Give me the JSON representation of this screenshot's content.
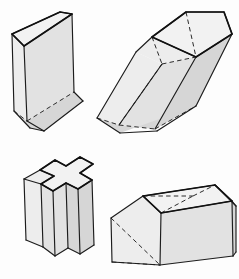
{
  "sheet": {
    "title": "Four three-dimensional solids line drawing",
    "background_color": "#fdfdfd",
    "width": 239,
    "height": 279,
    "visible_text": []
  },
  "style": {
    "visible_edge_color": "#1c1c1c",
    "hidden_edge_color": "#2b2b2b",
    "hidden_edge_style": "dashed",
    "face_fill_light": "#ededed",
    "face_fill_mid": "#e2e2e2",
    "face_fill_dark": "#d6d6d6",
    "face_fill_top": "#f2f2f2"
  },
  "figures": [
    {
      "id": "triangular-prism",
      "name": "Upright triangular prism",
      "position": "top-left",
      "solid_type": "prism",
      "cross_section": "triangle",
      "orientation": "vertical",
      "top_face": {
        "shape": "triangle",
        "points": "12,34 60,12 72,14 24,46"
      },
      "faces": [
        {
          "name": "top-triangle",
          "shade": "face-top",
          "points": "12,34 60,12 72,14 24,46"
        },
        {
          "name": "front-left-rectangle",
          "shade": "face-light",
          "points": "12,34 24,46 27,121 14,111"
        },
        {
          "name": "front-right-rectangle",
          "shade": "face-mid",
          "points": "24,46 72,14 74,92 27,121"
        },
        {
          "name": "bottom-wedge-left",
          "shade": "face-dark",
          "points": "14,111 27,121 44,131 30,128"
        },
        {
          "name": "bottom-wedge-right",
          "shade": "face-dark",
          "points": "27,121 74,92 83,101 44,131"
        }
      ],
      "visible_edges": [
        "12,34 60,12",
        "60,12 72,14",
        "72,14 24,46",
        "24,46 12,34",
        "12,34 14,111",
        "24,46 27,121",
        "72,14 74,92",
        "14,111 30,128",
        "30,128 44,131",
        "44,131 83,101",
        "83,101 74,92",
        "27,121 44,131"
      ],
      "hidden_edges": [
        "14,111 27,121",
        "27,121 74,92"
      ]
    },
    {
      "id": "oblique-pentagonal-prism",
      "name": "Oblique pentagonal prism leaning to the right",
      "position": "top-right",
      "solid_type": "prism",
      "cross_section": "pentagon",
      "orientation": "oblique",
      "top_face": {
        "shape": "pentagon",
        "points": "152,37 186,12 224,12 232,34 196,57"
      },
      "faces": [
        {
          "name": "top-pentagon",
          "shade": "face-top",
          "points": "152,37 186,12 224,12 232,34 196,57"
        },
        {
          "name": "upper-left-band",
          "shade": "face-light",
          "points": "152,37 196,57 162,64 136,52"
        },
        {
          "name": "left-long-face",
          "shade": "face-light",
          "points": "136,52 162,64 119,125 97,118"
        },
        {
          "name": "front-long-face",
          "shade": "face-mid",
          "points": "162,64 196,57 155,129 119,125"
        },
        {
          "name": "right-long-face",
          "shade": "face-dark",
          "points": "196,57 232,34 196,106 155,129"
        },
        {
          "name": "bottom-pentagon",
          "shade": "face-dark",
          "points": "97,118 119,125 155,129 196,106 120,133"
        }
      ],
      "visible_edges": [
        "152,37 186,12",
        "186,12 224,12",
        "224,12 232,34",
        "232,34 196,57",
        "196,57 152,37",
        "152,37 136,52",
        "136,52 97,118",
        "97,118 120,133",
        "120,133 157,131",
        "157,131 196,106",
        "232,34 196,106",
        "196,57 155,129",
        "162,64 119,125"
      ],
      "hidden_edges": [
        "152,37 162,64",
        "162,64 196,57",
        "162,64 119,125",
        "119,125 155,129",
        "97,118 119,125",
        "155,129 196,106",
        "186,12 196,57"
      ]
    },
    {
      "id": "cross-prism",
      "name": "Cross shaped (plus sign) prism standing upright",
      "position": "bottom-left",
      "solid_type": "prism",
      "cross_section": "cross",
      "orientation": "vertical",
      "top_face": {
        "shape": "plus",
        "points": "40,170 55,160 66,166 80,157 93,164 80,173 92,180 78,189 66,183 53,191 41,184 54,176"
      },
      "faces": [
        {
          "name": "top-cross",
          "shade": "face-top",
          "points": "40,170 55,160 66,166 80,157 93,164 80,173 92,180 78,189 66,183 53,191 41,184 54,176"
        },
        {
          "name": "left-arm-front",
          "shade": "face-light",
          "points": "24,179 40,170 54,176 41,184"
        },
        {
          "name": "left-column-face",
          "shade": "face-light",
          "points": "24,179 41,184 43,247 26,240"
        },
        {
          "name": "center-front-face",
          "shade": "face-mid",
          "points": "41,184 53,191 55,256 43,247"
        },
        {
          "name": "center-right-face",
          "shade": "face-mid",
          "points": "53,191 66,183 68,248 55,256"
        },
        {
          "name": "right-column-face",
          "shade": "face-dark",
          "points": "66,183 78,189 80,254 68,248"
        },
        {
          "name": "far-right-face",
          "shade": "face-dark",
          "points": "78,189 92,180 94,245 80,254"
        }
      ],
      "visible_edges": [
        "40,170 55,160",
        "55,160 66,166",
        "66,166 80,157",
        "80,157 93,164",
        "93,164 80,173",
        "80,173 92,180",
        "92,180 78,189",
        "78,189 66,183",
        "66,183 53,191",
        "53,191 41,184",
        "41,184 54,176",
        "54,176 40,170",
        "24,179 40,170",
        "24,179 26,240",
        "26,240 43,247",
        "41,184 43,247",
        "43,247 55,256",
        "53,191 55,256",
        "55,256 68,248",
        "66,183 68,248",
        "68,248 80,254",
        "78,189 80,254",
        "80,254 94,245",
        "92,180 94,245",
        "24,179 41,184"
      ],
      "hidden_edges": []
    },
    {
      "id": "house-prism",
      "name": "House shaped pentagonal prism lying horizontally",
      "position": "bottom-right",
      "solid_type": "prism",
      "cross_section": "pentagon",
      "orientation": "horizontal",
      "top_face": {
        "shape": "roof",
        "points": "143,196 215,185 232,201 161,213"
      },
      "faces": [
        {
          "name": "roof-left-slope",
          "shade": "face-top",
          "points": "143,196 215,185 232,201 161,213"
        },
        {
          "name": "roof-right-slope",
          "shade": "face-light",
          "points": "161,213 232,201 236,206 165,219"
        },
        {
          "name": "gable-front",
          "shade": "face-light",
          "points": "111,218 143,196 161,213 160,265 112,262"
        },
        {
          "name": "side-long-face",
          "shade": "face-mid",
          "points": "160,265 161,213 232,201 233,256"
        },
        {
          "name": "right-end-face",
          "shade": "face-dark",
          "points": "232,201 236,206 236,252 233,256"
        }
      ],
      "visible_edges": [
        "143,196 215,185",
        "215,185 232,201",
        "232,201 161,213",
        "161,213 143,196",
        "143,196 111,218",
        "111,218 112,262",
        "112,262 160,265",
        "160,265 161,213",
        "160,265 233,256",
        "233,256 232,201",
        "215,185 236,206",
        "236,206 236,252",
        "236,252 233,256",
        "232,201 236,206"
      ],
      "hidden_edges": [
        "111,218 160,265",
        "161,213 193,196",
        "193,196 215,185",
        "112,262 160,265",
        "143,196 193,196"
      ]
    }
  ]
}
